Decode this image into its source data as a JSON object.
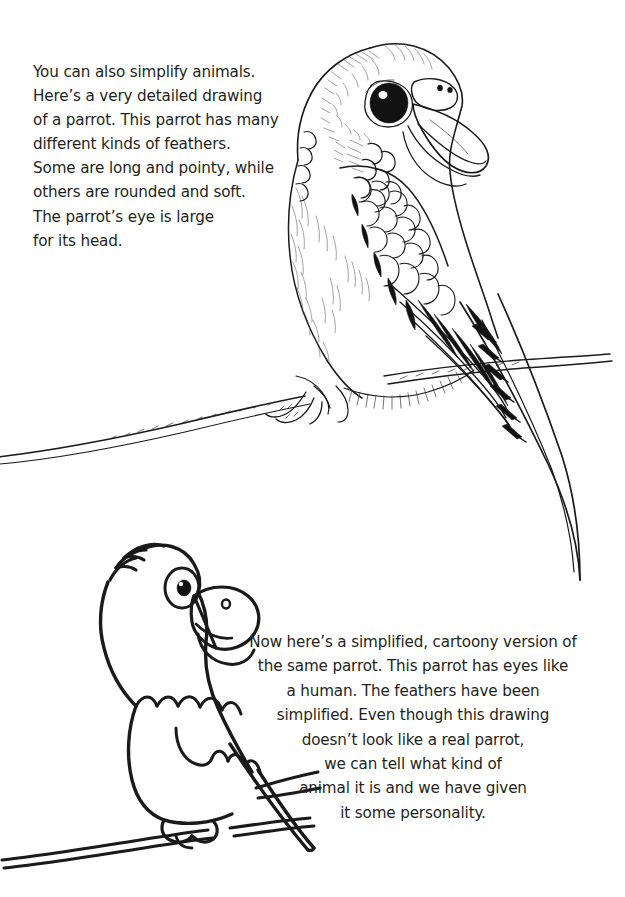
{
  "page": {
    "background_color": "#ffffff",
    "ink_color": "#1a1a1a",
    "text_color": "#231f20",
    "width": 625,
    "height": 897
  },
  "intro_text": {
    "lines": [
      "You can also simplify animals.",
      "Here’s a very detailed drawing",
      "of a parrot. This parrot has many",
      "different kinds of feathers.",
      "Some are long and pointy, while",
      "others are rounded and soft.",
      "The parrot’s eye is large",
      "for its head."
    ]
  },
  "caption_text": {
    "lines": [
      "Now here’s a simplified, cartoony version of",
      "the same parrot. This parrot has eyes like",
      "a human. The feathers have been",
      "simplified. Even though this drawing",
      "doesn’t look like a real parrot,",
      "we can tell what kind of",
      "animal it is and we have given",
      "it some personality."
    ]
  },
  "illustrations": [
    {
      "id": "detailed-parrot",
      "name": "detailed-parrot-drawing",
      "description": "Highly detailed pen-and-ink drawing of a parrot perched on a thin branch, facing right, with a large dark eye, hooked beak, scalloped wing feathers, soft hatched breast, and a long pointed tail."
    },
    {
      "id": "cartoon-parrot",
      "name": "cartoon-parrot-drawing",
      "description": "Simplified cartoony line drawing of the same parrot with a human-like round eye, a crest, simplified scalloped feathers, a single foot on a branch and a long tapering tail."
    }
  ]
}
